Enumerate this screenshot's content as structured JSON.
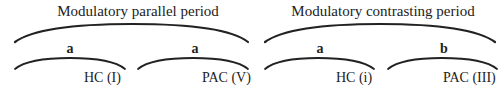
{
  "periods": [
    {
      "title": "Modulatory parallel period",
      "phrases": [
        {
          "label": "a",
          "cadence": "HC (I)"
        },
        {
          "label": "a",
          "cadence": "PAC (V)"
        }
      ]
    },
    {
      "title": "Modulatory contrasting period",
      "phrases": [
        {
          "label": "a",
          "cadence": "HC (i)"
        },
        {
          "label": "b",
          "cadence": "PAC (III)"
        }
      ]
    }
  ],
  "colors": {
    "ink": "#222222",
    "background": "#ffffff"
  }
}
